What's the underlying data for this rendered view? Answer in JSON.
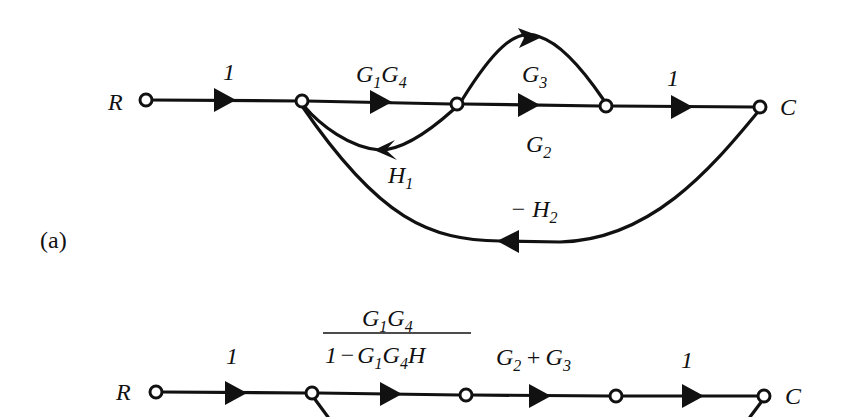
{
  "figure_a": {
    "tag": "(a)",
    "input": "R",
    "output": "C",
    "edges": {
      "e1": "1",
      "g1g4": {
        "G": "G",
        "s1": "1",
        "s2": "4"
      },
      "g3": {
        "G": "G",
        "s": "3"
      },
      "g2": {
        "G": "G",
        "s": "2"
      },
      "e_last": "1",
      "h1": {
        "H": "H",
        "s": "1"
      },
      "h2": {
        "minus": "−",
        "H": "H",
        "s": "2"
      }
    }
  },
  "figure_b": {
    "input": "R",
    "output": "C",
    "edges": {
      "e1": "1",
      "frac_num": {
        "G1": "G",
        "s1": "1",
        "G2": "G",
        "s2": "4"
      },
      "frac_den": {
        "one": "1",
        "minus": "−",
        "G1": "G",
        "s1": "1",
        "G2": "G",
        "s2": "4",
        "H": "H"
      },
      "sum": {
        "G1": "G",
        "s1": "2",
        "plus": "+",
        "G2": "G",
        "s2": "3"
      },
      "e_last": "1"
    }
  }
}
